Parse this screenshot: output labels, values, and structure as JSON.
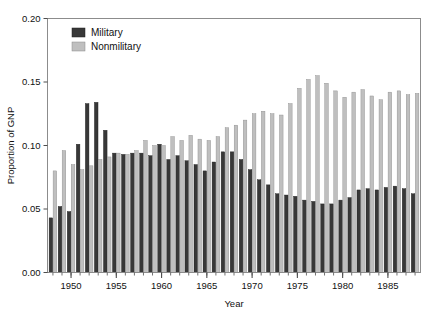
{
  "chart_data": {
    "type": "bar",
    "title": "",
    "subtitle": "",
    "xlabel": "Year",
    "ylabel": "Proportion of GNP",
    "xlim": [
      1947.4,
      1988.6
    ],
    "ylim": [
      0.0,
      0.2
    ],
    "grid": false,
    "legend_position": "top-left",
    "y_ticks": [
      0.0,
      0.05,
      0.1,
      0.15,
      0.2
    ],
    "y_tick_labels": [
      "0.00",
      "0.05",
      "0.10",
      "0.15",
      "0.20"
    ],
    "x_ticks": [
      1950,
      1955,
      1960,
      1965,
      1970,
      1975,
      1980,
      1985
    ],
    "x_tick_labels": [
      "1950",
      "1955",
      "1960",
      "1965",
      "1970",
      "1975",
      "1980",
      "1985"
    ],
    "x_minor_ticks_every": 1,
    "categories": [
      1948,
      1949,
      1950,
      1951,
      1952,
      1953,
      1954,
      1955,
      1956,
      1957,
      1958,
      1959,
      1960,
      1961,
      1962,
      1963,
      1964,
      1965,
      1966,
      1967,
      1968,
      1969,
      1970,
      1971,
      1972,
      1973,
      1974,
      1975,
      1976,
      1977,
      1978,
      1979,
      1980,
      1981,
      1982,
      1983,
      1984,
      1985,
      1986,
      1987,
      1988
    ],
    "series": [
      {
        "name": "Military",
        "color": "#383838",
        "values": [
          0.043,
          0.052,
          0.048,
          0.101,
          0.133,
          0.134,
          0.112,
          0.094,
          0.093,
          0.094,
          0.094,
          0.092,
          0.101,
          0.089,
          0.092,
          0.088,
          0.085,
          0.08,
          0.087,
          0.095,
          0.095,
          0.089,
          0.081,
          0.073,
          0.069,
          0.062,
          0.061,
          0.06,
          0.057,
          0.056,
          0.054,
          0.054,
          0.057,
          0.059,
          0.065,
          0.066,
          0.065,
          0.067,
          0.068,
          0.066,
          0.062
        ]
      },
      {
        "name": "Nonmilitary",
        "color": "#bfbfbf",
        "values": [
          0.08,
          0.096,
          0.085,
          0.081,
          0.084,
          0.089,
          0.091,
          0.094,
          0.093,
          0.096,
          0.104,
          0.1,
          0.1,
          0.107,
          0.104,
          0.108,
          0.105,
          0.104,
          0.107,
          0.114,
          0.116,
          0.12,
          0.125,
          0.127,
          0.125,
          0.124,
          0.133,
          0.145,
          0.152,
          0.155,
          0.149,
          0.143,
          0.138,
          0.142,
          0.144,
          0.139,
          0.136,
          0.142,
          0.143,
          0.14,
          0.141
        ]
      }
    ]
  },
  "legend": {
    "items": [
      {
        "label": "Military",
        "color": "#383838"
      },
      {
        "label": "Nonmilitary",
        "color": "#bfbfbf"
      }
    ]
  },
  "axes": {
    "y_title": "Proportion of GNP",
    "x_title": "Year"
  }
}
